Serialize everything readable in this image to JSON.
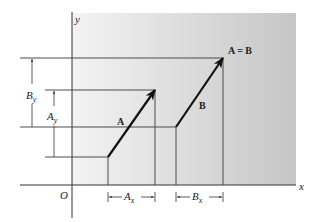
{
  "figure": {
    "type": "vector-equality-diagram",
    "colors": {
      "background": "#ffffff",
      "panel_light": "#f2f2f2",
      "panel_dark": "#c9c9c9",
      "line": "#3a3a3a",
      "vector": "#111111"
    }
  },
  "axes": {
    "x_label": "x",
    "y_label": "y",
    "origin_label": "O"
  },
  "vectors": {
    "A": {
      "label": "A",
      "start": [
        108,
        157
      ],
      "end": [
        155,
        90
      ]
    },
    "B": {
      "label": "B",
      "start": [
        176,
        127
      ],
      "end": [
        223,
        58
      ]
    }
  },
  "annotations": {
    "equality": "A = B",
    "Ax": {
      "base": "A",
      "sub": "x"
    },
    "Bx": {
      "base": "B",
      "sub": "x"
    },
    "Ay": {
      "base": "A",
      "sub": "y"
    },
    "By": {
      "base": "B",
      "sub": "y"
    }
  }
}
